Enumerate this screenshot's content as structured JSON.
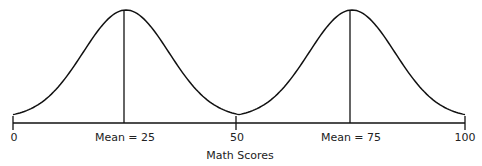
{
  "chart_data": {
    "type": "line",
    "title": "",
    "xlabel": "Math Scores",
    "ylabel": "",
    "xlim": [
      0,
      100
    ],
    "grid": false,
    "legend": null,
    "x_ticks": [
      0,
      50,
      100
    ],
    "tick_labels": [
      "0",
      "50",
      "100"
    ],
    "series": [
      {
        "name": "Distribution 1",
        "kind": "normal",
        "mean": 25,
        "label": "Mean = 25"
      },
      {
        "name": "Distribution 2",
        "kind": "normal",
        "mean": 75,
        "label": "Mean = 75"
      }
    ],
    "annotations": [
      {
        "x": 25,
        "text": "Mean = 25",
        "vertical_line": true
      },
      {
        "x": 75,
        "text": "Mean = 75",
        "vertical_line": true
      }
    ]
  },
  "labels": {
    "tick0": "0",
    "tick50": "50",
    "tick100": "100",
    "mean1": "Mean = 25",
    "mean2": "Mean = 75",
    "xlabel": "Math Scores"
  }
}
